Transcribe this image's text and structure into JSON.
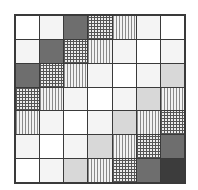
{
  "chart_data": {
    "type": "heatmap",
    "title": "",
    "xlabel": "",
    "ylabel": "",
    "rows": 7,
    "cols": 7,
    "grid": true,
    "legend": null,
    "levels": {
      "0": "white (blank)",
      "1": "light stipple",
      "2": "medium-gray fine stipple",
      "3": "vertical lines",
      "4": "crosshatch",
      "5": "dark stipple",
      "6": "very dark stipple"
    },
    "values": [
      [
        0,
        1,
        5,
        4,
        3,
        1,
        0
      ],
      [
        1,
        5,
        4,
        3,
        1,
        0,
        1
      ],
      [
        5,
        4,
        3,
        1,
        0,
        1,
        2
      ],
      [
        4,
        3,
        1,
        0,
        1,
        2,
        3
      ],
      [
        3,
        1,
        0,
        1,
        2,
        3,
        4
      ],
      [
        1,
        0,
        1,
        2,
        3,
        4,
        5
      ],
      [
        0,
        1,
        2,
        3,
        4,
        5,
        6
      ]
    ]
  }
}
